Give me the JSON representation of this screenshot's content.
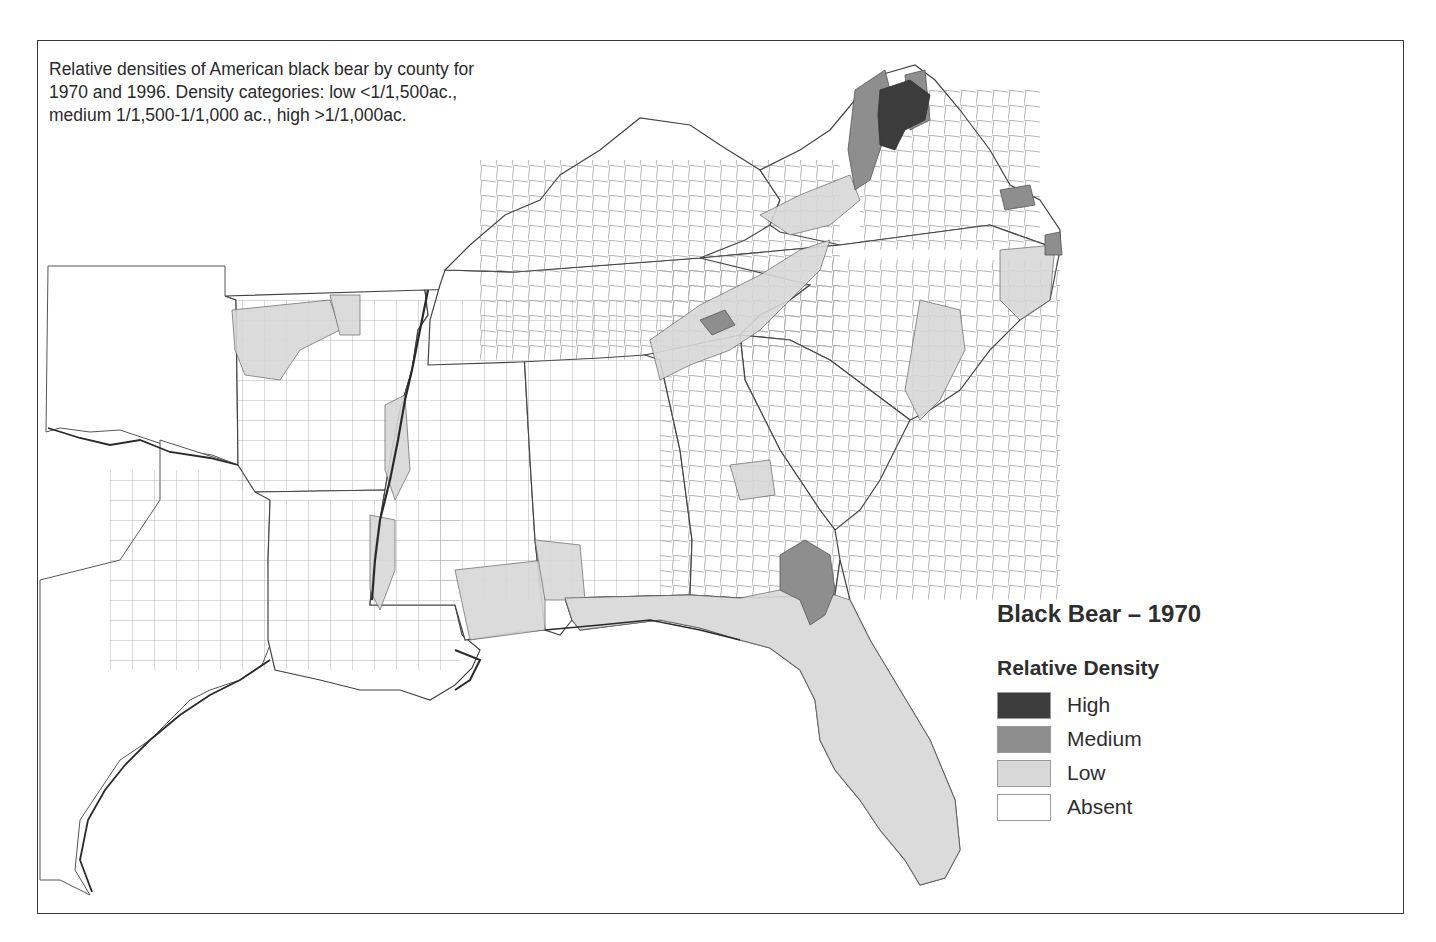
{
  "caption": {
    "line1": "Relative densities of American black bear by county for",
    "line2": "1970 and 1996. Density categories: low <1/1,500ac.,",
    "line3": "medium 1/1,500-1/1,000 ac., high >1/1,000ac."
  },
  "legend": {
    "title": "Black Bear – 1970",
    "subtitle": "Relative Density",
    "items": [
      {
        "label": "High",
        "color": "#3c3c3c"
      },
      {
        "label": "Medium",
        "color": "#8e8e8e"
      },
      {
        "label": "Low",
        "color": "#d8d8d8"
      },
      {
        "label": "Absent",
        "color": "#ffffff"
      }
    ]
  },
  "map": {
    "region": "Southeastern United States",
    "year": "1970",
    "colors": {
      "high": "#3c3c3c",
      "medium": "#8e8e8e",
      "low": "#d8d8d8",
      "absent": "#ffffff",
      "county_border": "#555555",
      "state_border": "#333333"
    }
  }
}
